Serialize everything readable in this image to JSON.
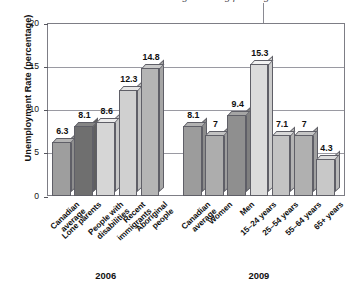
{
  "annotation": {
    "text": "graduating from high school",
    "pointer_target": "15.3"
  },
  "chart_data": {
    "type": "bar",
    "title": "",
    "xlabel": "",
    "ylabel": "Unemployment Rate (percentage)",
    "ylim": [
      0,
      20
    ],
    "yticks": [
      "0",
      "5",
      "10",
      "15",
      "20"
    ],
    "grid": true,
    "legend": "none",
    "groups": [
      {
        "name": "2006",
        "categories": [
          "Canadian\naverage",
          "Lone parents",
          "People with\ndisabilities",
          "Recent\nimmigrants",
          "Aboriginal\npeople"
        ],
        "values": [
          6.3,
          8.1,
          8.6,
          12.3,
          14.8
        ],
        "value_labels": [
          "6.3",
          "8.1",
          "8.6",
          "12.3",
          "14.8"
        ]
      },
      {
        "name": "2009",
        "categories": [
          "Canadian\naverage",
          "Women",
          "Men",
          "15–24 years",
          "25–54 years",
          "55–64 years",
          "65+ years"
        ],
        "values": [
          8.1,
          7,
          9.4,
          15.3,
          7.1,
          7,
          4.3
        ],
        "value_labels": [
          "8.1",
          "7",
          "9.4",
          "15.3",
          "7.1",
          "7",
          "4.3"
        ]
      }
    ],
    "bar_colors_2006": [
      "#9e9e9e",
      "#6f6f6f",
      "#d6d6d6",
      "#d0d0d0",
      "#b5b5b5"
    ],
    "bar_colors_2009": [
      "#9c9c9c",
      "#adadad",
      "#8f8f8f",
      "#dcdcdc",
      "#c3c3c3",
      "#b0b0b0",
      "#c8c8c8"
    ]
  }
}
